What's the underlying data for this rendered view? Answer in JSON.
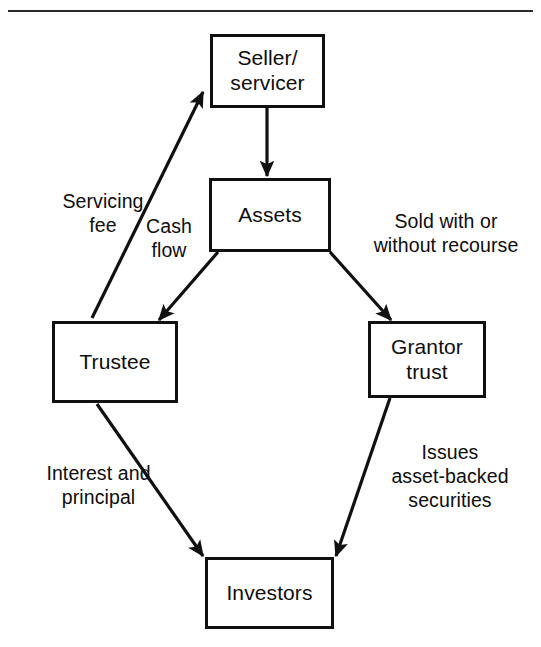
{
  "figure": {
    "ink_color": "#101010",
    "background_color": "#ffffff",
    "rule_color": "#2b2b2b"
  },
  "nodes": [
    {
      "id": "seller",
      "label": "Seller/\nservicer"
    },
    {
      "id": "assets",
      "label": "Assets"
    },
    {
      "id": "trustee",
      "label": "Trustee"
    },
    {
      "id": "grantor",
      "label": "Grantor\ntrust"
    },
    {
      "id": "investors",
      "label": "Investors"
    }
  ],
  "edge_labels": [
    {
      "id": "servicing-fee",
      "text": "Servicing\nfee"
    },
    {
      "id": "cash-flow",
      "text": "Cash\nflow"
    },
    {
      "id": "sold-recourse",
      "text": "Sold with or\nwithout recourse"
    },
    {
      "id": "interest-principal",
      "text": "Interest and\nprincipal"
    },
    {
      "id": "issues-securities",
      "text": "Issues\nasset-backed\nsecurities"
    }
  ],
  "edges": [
    {
      "id": "seller-to-assets",
      "from": "seller",
      "to": "assets",
      "label": ""
    },
    {
      "id": "trustee-to-seller",
      "from": "trustee",
      "to": "seller",
      "label": "Servicing fee"
    },
    {
      "id": "assets-to-trustee",
      "from": "assets",
      "to": "trustee",
      "label": "Cash flow"
    },
    {
      "id": "assets-to-grantor",
      "from": "assets",
      "to": "grantor",
      "label": "Sold with or without recourse"
    },
    {
      "id": "trustee-to-investors",
      "from": "trustee",
      "to": "investors",
      "label": "Interest and principal"
    },
    {
      "id": "grantor-to-investors",
      "from": "grantor",
      "to": "investors",
      "label": "Issues asset-backed securities"
    }
  ]
}
